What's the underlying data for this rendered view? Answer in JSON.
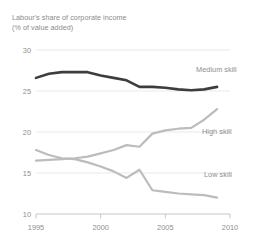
{
  "title": {
    "line1": "Labour's share of corporate income",
    "line2": "(% of value added)"
  },
  "colors": {
    "medium_skill": "#3d3d3d",
    "high_skill": "#bcbcbc",
    "low_skill": "#bcbcbc",
    "grid": "#e3e3e3",
    "axis": "#b9b9b9",
    "text": "#8e8e8e"
  },
  "axes": {
    "y_ticks": [
      "10",
      "15",
      "20",
      "25",
      "30"
    ],
    "x_ticks": [
      "1995",
      "2000",
      "2005",
      "2010"
    ]
  },
  "series_labels": {
    "medium": "Medium skill",
    "high": "High skill",
    "low": "Low skill"
  },
  "chart_data": {
    "type": "line",
    "title": "Labour's share of corporate income",
    "subtitle": "(% of value added)",
    "xlabel": "",
    "ylabel": "% of value added",
    "xlim": [
      1995,
      2010
    ],
    "ylim": [
      10,
      30
    ],
    "grid": true,
    "legend": "inline-right",
    "x": [
      1995,
      1996,
      1997,
      1998,
      1999,
      2000,
      2001,
      2002,
      2003,
      2004,
      2005,
      2006,
      2007,
      2008,
      2009
    ],
    "series": [
      {
        "name": "Medium skill",
        "color": "#3d3d3d",
        "values": [
          26.6,
          27.1,
          27.3,
          27.3,
          27.3,
          26.9,
          26.6,
          26.3,
          25.5,
          25.5,
          25.4,
          25.2,
          25.1,
          25.2,
          25.5
        ]
      },
      {
        "name": "High skill",
        "color": "#bcbcbc",
        "values": [
          16.5,
          16.6,
          16.7,
          16.8,
          17.0,
          17.4,
          17.8,
          18.4,
          18.2,
          19.8,
          20.2,
          20.4,
          20.5,
          21.5,
          22.8
        ]
      },
      {
        "name": "Low skill",
        "color": "#bcbcbc",
        "values": [
          17.8,
          17.2,
          16.8,
          16.7,
          16.3,
          15.8,
          15.2,
          14.4,
          15.4,
          12.9,
          12.7,
          12.5,
          12.4,
          12.3,
          12.0
        ]
      }
    ]
  }
}
